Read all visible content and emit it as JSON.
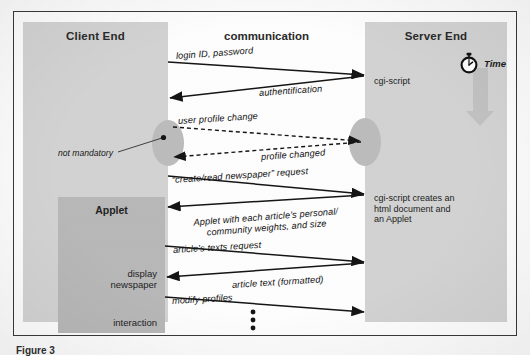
{
  "figure": {
    "columns": {
      "client": {
        "title": "Client End"
      },
      "middle": {
        "title": "communication"
      },
      "server": {
        "title": "Server End"
      }
    },
    "time_axis": {
      "label": "Time",
      "icon": "stopwatch-icon"
    },
    "client_nodes": {
      "applet": "Applet",
      "display_newspaper": "display\nnewspaper",
      "display_newspaper_line1": "display",
      "display_newspaper_line2": "newspaper",
      "interaction": "interaction",
      "not_mandatory": "not mandatory"
    },
    "server_nodes": {
      "cgi_script": "cgi-script",
      "creates_line1": "cgi-script creates an",
      "creates_line2": "html document and",
      "creates_line3": "an Applet"
    },
    "messages": [
      {
        "id": "m1",
        "label": "login ID, password",
        "direction": "client-to-server",
        "style": "solid"
      },
      {
        "id": "m2",
        "label": "authentification",
        "direction": "server-to-client",
        "style": "solid"
      },
      {
        "id": "m3",
        "label": "user profile change",
        "direction": "client-to-server",
        "style": "dashed"
      },
      {
        "id": "m4",
        "label": "profile changed",
        "direction": "server-to-client",
        "style": "dashed"
      },
      {
        "id": "m5",
        "label": "“create/read newspaper” request",
        "direction": "client-to-server",
        "style": "solid"
      },
      {
        "id": "m6",
        "label_line1": "Applet with each article’s personal/",
        "label_line2": "community weights, and size",
        "direction": "server-to-client",
        "style": "solid"
      },
      {
        "id": "m7",
        "label": "article’s texts request",
        "direction": "client-to-server",
        "style": "solid"
      },
      {
        "id": "m8",
        "label": "article text (formatted)",
        "direction": "server-to-client",
        "style": "solid"
      },
      {
        "id": "m9",
        "label": "modify profiles",
        "direction": "client-to-server",
        "style": "solid"
      }
    ],
    "continuation": "⋮",
    "caption": "Figure 3"
  },
  "colors": {
    "column_fill": "#d4d4d4",
    "applet_fill": "#b9b9b9",
    "bulge_fill": "#bdbdbd",
    "time_arrow": "#c3c3c3",
    "line": "#1a1a1a",
    "frame": "#3a3a3a",
    "page": "#ffffff"
  }
}
